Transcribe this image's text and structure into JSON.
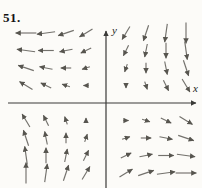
{
  "problem": {
    "number": "51."
  },
  "axes": {
    "x_label": "x",
    "y_label": "y"
  },
  "colors": {
    "background": "#fcfbf8",
    "axis": "#3a3a38",
    "arrow": "#73716c",
    "arrow_head": "#57554f",
    "text": "#121212"
  },
  "chart_data": {
    "type": "quiver",
    "title": "",
    "xlabel": "x",
    "ylabel": "y",
    "x_range": [
      -5,
      5
    ],
    "y_range": [
      -5,
      5
    ],
    "grid_x": [
      -4,
      -3,
      -2,
      -1,
      1,
      2,
      3,
      4
    ],
    "grid_y": [
      -4,
      -3,
      -2,
      -1,
      1,
      2,
      3,
      4
    ],
    "field_formula": "F(x, y) = (x - y) i + (-x - y) j",
    "arrow_length_rule": "length proportional to |F| = sqrt(2(x^2+y^2))",
    "vectors": [
      {
        "x": -4,
        "y": 4,
        "u": -8,
        "v": 0
      },
      {
        "x": -3,
        "y": 4,
        "u": -7,
        "v": -1
      },
      {
        "x": -2,
        "y": 4,
        "u": -6,
        "v": -2
      },
      {
        "x": -1,
        "y": 4,
        "u": -5,
        "v": -3
      },
      {
        "x": 1,
        "y": 4,
        "u": -3,
        "v": -5
      },
      {
        "x": 2,
        "y": 4,
        "u": -2,
        "v": -6
      },
      {
        "x": 3,
        "y": 4,
        "u": -1,
        "v": -7
      },
      {
        "x": 4,
        "y": 4,
        "u": 0,
        "v": -8
      },
      {
        "x": -4,
        "y": 3,
        "u": -7,
        "v": 1
      },
      {
        "x": -3,
        "y": 3,
        "u": -6,
        "v": 0
      },
      {
        "x": -2,
        "y": 3,
        "u": -5,
        "v": -1
      },
      {
        "x": -1,
        "y": 3,
        "u": -4,
        "v": -2
      },
      {
        "x": 1,
        "y": 3,
        "u": -2,
        "v": -4
      },
      {
        "x": 2,
        "y": 3,
        "u": -1,
        "v": -5
      },
      {
        "x": 3,
        "y": 3,
        "u": 0,
        "v": -6
      },
      {
        "x": 4,
        "y": 3,
        "u": 1,
        "v": -7
      },
      {
        "x": -4,
        "y": 2,
        "u": -6,
        "v": 2
      },
      {
        "x": -3,
        "y": 2,
        "u": -5,
        "v": 1
      },
      {
        "x": -2,
        "y": 2,
        "u": -4,
        "v": 0
      },
      {
        "x": -1,
        "y": 2,
        "u": -3,
        "v": -1
      },
      {
        "x": 1,
        "y": 2,
        "u": -1,
        "v": -3
      },
      {
        "x": 2,
        "y": 2,
        "u": 0,
        "v": -4
      },
      {
        "x": 3,
        "y": 2,
        "u": 1,
        "v": -5
      },
      {
        "x": 4,
        "y": 2,
        "u": 2,
        "v": -6
      },
      {
        "x": -4,
        "y": 1,
        "u": -5,
        "v": 3
      },
      {
        "x": -3,
        "y": 1,
        "u": -4,
        "v": 2
      },
      {
        "x": -2,
        "y": 1,
        "u": -3,
        "v": 1
      },
      {
        "x": -1,
        "y": 1,
        "u": -2,
        "v": 0
      },
      {
        "x": 1,
        "y": 1,
        "u": 0,
        "v": -2
      },
      {
        "x": 2,
        "y": 1,
        "u": 1,
        "v": -3
      },
      {
        "x": 3,
        "y": 1,
        "u": 2,
        "v": -4
      },
      {
        "x": 4,
        "y": 1,
        "u": 3,
        "v": -5
      },
      {
        "x": -4,
        "y": -1,
        "u": -3,
        "v": 5
      },
      {
        "x": -3,
        "y": -1,
        "u": -2,
        "v": 4
      },
      {
        "x": -2,
        "y": -1,
        "u": -1,
        "v": 3
      },
      {
        "x": -1,
        "y": -1,
        "u": 0,
        "v": 2
      },
      {
        "x": 1,
        "y": -1,
        "u": 2,
        "v": 0
      },
      {
        "x": 2,
        "y": -1,
        "u": 3,
        "v": -1
      },
      {
        "x": 3,
        "y": -1,
        "u": 4,
        "v": -2
      },
      {
        "x": 4,
        "y": -1,
        "u": 5,
        "v": -3
      },
      {
        "x": -4,
        "y": -2,
        "u": -2,
        "v": 6
      },
      {
        "x": -3,
        "y": -2,
        "u": -1,
        "v": 5
      },
      {
        "x": -2,
        "y": -2,
        "u": 0,
        "v": 4
      },
      {
        "x": -1,
        "y": -2,
        "u": 1,
        "v": 3
      },
      {
        "x": 1,
        "y": -2,
        "u": 3,
        "v": 1
      },
      {
        "x": 2,
        "y": -2,
        "u": 4,
        "v": 0
      },
      {
        "x": 3,
        "y": -2,
        "u": 5,
        "v": -1
      },
      {
        "x": 4,
        "y": -2,
        "u": 6,
        "v": -2
      },
      {
        "x": -4,
        "y": -3,
        "u": -1,
        "v": 7
      },
      {
        "x": -3,
        "y": -3,
        "u": 0,
        "v": 6
      },
      {
        "x": -2,
        "y": -3,
        "u": 1,
        "v": 5
      },
      {
        "x": -1,
        "y": -3,
        "u": 2,
        "v": 4
      },
      {
        "x": 1,
        "y": -3,
        "u": 4,
        "v": 2
      },
      {
        "x": 2,
        "y": -3,
        "u": 5,
        "v": 1
      },
      {
        "x": 3,
        "y": -3,
        "u": 6,
        "v": 0
      },
      {
        "x": 4,
        "y": -3,
        "u": 7,
        "v": -1
      },
      {
        "x": -4,
        "y": -4,
        "u": 0,
        "v": 8
      },
      {
        "x": -3,
        "y": -4,
        "u": 1,
        "v": 7
      },
      {
        "x": -2,
        "y": -4,
        "u": 2,
        "v": 6
      },
      {
        "x": -1,
        "y": -4,
        "u": 3,
        "v": 5
      },
      {
        "x": 1,
        "y": -4,
        "u": 5,
        "v": 3
      },
      {
        "x": 2,
        "y": -4,
        "u": 6,
        "v": 2
      },
      {
        "x": 3,
        "y": -4,
        "u": 7,
        "v": 1
      },
      {
        "x": 4,
        "y": -4,
        "u": 8,
        "v": 0
      }
    ]
  }
}
